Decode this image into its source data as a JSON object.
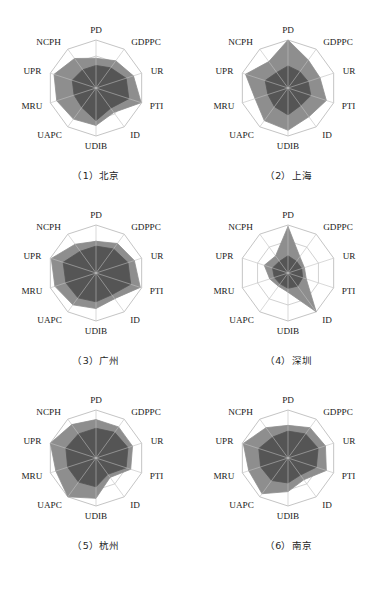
{
  "figure": {
    "type": "radar-grid",
    "rows": 3,
    "cols": 2,
    "axes": [
      "PD",
      "GDPPC",
      "UR",
      "PTI",
      "ID",
      "UDIB",
      "UAPC",
      "MRU",
      "UPR",
      "NCPH"
    ],
    "series_names": [
      "outer-light-gray",
      "inner-dark-gray"
    ],
    "colors": {
      "outer_fill": "#8e8e8e",
      "inner_fill": "#555555",
      "grid_line": "#bdbdbd",
      "spoke_line": "#c9c9c9",
      "label_text": "#1a1a1a",
      "background": "#ffffff"
    },
    "rmax": 1.0,
    "rings": 3
  },
  "chart_data": [
    {
      "type": "radar",
      "title": "（1）北京",
      "index": "1",
      "city": "北京",
      "categories": [
        "PD",
        "GDPPC",
        "UR",
        "PTI",
        "ID",
        "UDIB",
        "UAPC",
        "MRU",
        "UPR",
        "NCPH"
      ],
      "series": [
        {
          "name": "outer-light-gray",
          "values": [
            0.62,
            0.7,
            0.82,
            0.99,
            0.63,
            0.78,
            0.8,
            0.86,
            0.92,
            0.76
          ]
        },
        {
          "name": "inner-dark-gray",
          "values": [
            0.47,
            0.52,
            0.66,
            0.72,
            0.52,
            0.68,
            0.5,
            0.48,
            0.52,
            0.47
          ]
        }
      ],
      "rlim": [
        0,
        1
      ]
    },
    {
      "type": "radar",
      "title": "（2）上海",
      "index": "2",
      "city": "上海",
      "categories": [
        "PD",
        "GDPPC",
        "UR",
        "PTI",
        "ID",
        "UDIB",
        "UAPC",
        "MRU",
        "UPR",
        "NCPH"
      ],
      "series": [
        {
          "name": "outer-light-gray",
          "values": [
            1.0,
            0.72,
            0.7,
            0.84,
            0.74,
            0.88,
            0.84,
            0.72,
            0.93,
            0.68
          ]
        },
        {
          "name": "inner-dark-gray",
          "values": [
            0.46,
            0.42,
            0.44,
            0.5,
            0.45,
            0.56,
            0.48,
            0.44,
            0.5,
            0.4
          ]
        }
      ],
      "rlim": [
        0,
        1
      ]
    },
    {
      "type": "radar",
      "title": "（3）广州",
      "index": "3",
      "city": "广州",
      "categories": [
        "PD",
        "GDPPC",
        "UR",
        "PTI",
        "ID",
        "UDIB",
        "UAPC",
        "MRU",
        "UPR",
        "NCPH"
      ],
      "series": [
        {
          "name": "outer-light-gray",
          "values": [
            0.66,
            0.76,
            0.84,
            0.97,
            0.66,
            0.74,
            0.82,
            0.9,
            0.98,
            0.74
          ]
        },
        {
          "name": "inner-dark-gray",
          "values": [
            0.56,
            0.62,
            0.7,
            0.76,
            0.56,
            0.6,
            0.64,
            0.66,
            0.72,
            0.56
          ]
        }
      ],
      "rlim": [
        0,
        1
      ]
    },
    {
      "type": "radar",
      "title": "（4）深圳",
      "index": "4",
      "city": "深圳",
      "categories": [
        "PD",
        "GDPPC",
        "UR",
        "PTI",
        "ID",
        "UDIB",
        "UAPC",
        "MRU",
        "UPR",
        "NCPH"
      ],
      "series": [
        {
          "name": "outer-light-gray",
          "values": [
            0.97,
            0.42,
            0.36,
            0.4,
            1.0,
            0.4,
            0.34,
            0.4,
            0.52,
            0.44
          ]
        },
        {
          "name": "inner-dark-gray",
          "values": [
            0.36,
            0.3,
            0.3,
            0.32,
            0.34,
            0.32,
            0.28,
            0.3,
            0.34,
            0.3
          ]
        }
      ],
      "rlim": [
        0,
        1
      ]
    },
    {
      "type": "radar",
      "title": "（5）杭州",
      "index": "5",
      "city": "杭州",
      "categories": [
        "PD",
        "GDPPC",
        "UR",
        "PTI",
        "ID",
        "UDIB",
        "UAPC",
        "MRU",
        "UPR",
        "NCPH"
      ],
      "series": [
        {
          "name": "outer-light-gray",
          "values": [
            0.8,
            0.8,
            0.8,
            0.76,
            0.5,
            0.84,
            1.0,
            0.88,
            1.0,
            0.86
          ]
        },
        {
          "name": "inner-dark-gray",
          "values": [
            0.62,
            0.66,
            0.7,
            0.66,
            0.42,
            0.6,
            0.62,
            0.62,
            0.66,
            0.62
          ]
        }
      ],
      "rlim": [
        0,
        1
      ]
    },
    {
      "type": "radar",
      "title": "（6）南京",
      "index": "6",
      "city": "南京",
      "categories": [
        "PD",
        "GDPPC",
        "UR",
        "PTI",
        "ID",
        "UDIB",
        "UAPC",
        "MRU",
        "UPR",
        "NCPH"
      ],
      "series": [
        {
          "name": "outer-light-gray",
          "values": [
            0.68,
            0.78,
            0.82,
            0.84,
            0.56,
            0.7,
            0.92,
            0.86,
            0.98,
            0.78
          ]
        },
        {
          "name": "inner-dark-gray",
          "values": [
            0.56,
            0.62,
            0.66,
            0.62,
            0.44,
            0.52,
            0.58,
            0.6,
            0.64,
            0.54
          ]
        }
      ],
      "rlim": [
        0,
        1
      ]
    }
  ]
}
